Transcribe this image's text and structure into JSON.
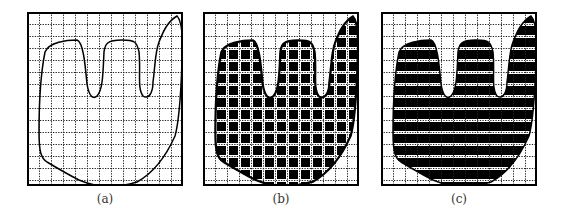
{
  "figure": {
    "panels": [
      {
        "id": "a",
        "caption": "(a)",
        "mode": "outline",
        "left": 27
      },
      {
        "id": "b",
        "caption": "(b)",
        "mode": "cells",
        "left": 203
      },
      {
        "id": "c",
        "caption": "(c)",
        "mode": "rows",
        "left": 381
      }
    ],
    "grid": {
      "cell_px": 12,
      "cols": 13,
      "rows": 14.5
    },
    "colors": {
      "ink": "#000000",
      "grid": "#333333",
      "background": "#ffffff"
    },
    "shape_description": "hand-like region with three finger lobes"
  }
}
